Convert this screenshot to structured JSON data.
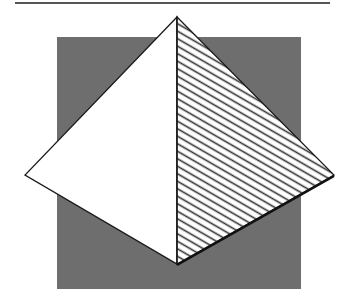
{
  "figure": {
    "top_rule": {
      "x1": 15,
      "x2": 330,
      "y": 3,
      "color": "#555555"
    },
    "square": {
      "x": 57,
      "y": 37,
      "width": 244,
      "height": 252,
      "fill": "#6e6e6e"
    },
    "diamond": {
      "top": [
        177,
        17
      ],
      "left": [
        25,
        175
      ],
      "right": [
        334,
        175
      ],
      "bottom": [
        177,
        264
      ],
      "stroke": "#1a1a1a",
      "left_fill": "#ffffff",
      "right_fill": "#ffffff",
      "hatch_color": "#333333",
      "hatch_spacing": 6.5
    }
  }
}
